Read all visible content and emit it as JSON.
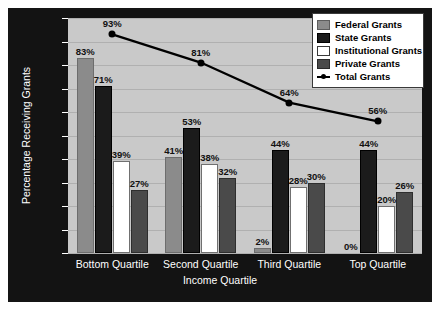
{
  "chart_data": {
    "type": "bar",
    "title": "",
    "xlabel": "Income Quartile",
    "ylabel": "Percentage Receiving Grants",
    "ylim": [
      0,
      100
    ],
    "ytick_step": 10,
    "yticks": [
      "0",
      "10",
      "20",
      "30",
      "40",
      "50",
      "60",
      "70",
      "80",
      "90",
      "100"
    ],
    "categories": [
      "Bottom Quartile",
      "Second Quartile",
      "Third Quartile",
      "Top Quartile"
    ],
    "grid": true,
    "legend_position": "top-right",
    "series": [
      {
        "name": "Federal Grants",
        "type": "bar",
        "color": "#8b8b8b",
        "values": [
          83,
          41,
          2,
          0
        ],
        "labels": [
          "83%",
          "41%",
          "2%",
          "0%"
        ]
      },
      {
        "name": "State Grants",
        "type": "bar",
        "color": "#1b1b1b",
        "values": [
          71,
          53,
          44,
          44
        ],
        "labels": [
          "71%",
          "53%",
          "44%",
          "44%"
        ]
      },
      {
        "name": "Institutional Grants",
        "type": "bar",
        "color": "#ffffff",
        "values": [
          39,
          38,
          28,
          20
        ],
        "labels": [
          "39%",
          "38%",
          "28%",
          "20%"
        ]
      },
      {
        "name": "Private Grants",
        "type": "bar",
        "color": "#4a4a4a",
        "values": [
          27,
          32,
          30,
          26
        ],
        "labels": [
          "27%",
          "32%",
          "30%",
          "26%"
        ]
      },
      {
        "name": "Total Grants",
        "type": "line",
        "color": "#000000",
        "values": [
          93,
          81,
          64,
          56
        ],
        "labels": [
          "93%",
          "81%",
          "64%",
          "56%"
        ]
      }
    ]
  },
  "legend": {
    "items": [
      {
        "label": "Federal Grants",
        "swatch": "federal"
      },
      {
        "label": "State Grants",
        "swatch": "state"
      },
      {
        "label": "Institutional Grants",
        "swatch": "institutional"
      },
      {
        "label": "Private Grants",
        "swatch": "private"
      },
      {
        "label": "Total Grants",
        "swatch": "line"
      }
    ]
  },
  "colors": {
    "frame_background": "#131313",
    "plot_background": "#c9c9c9",
    "gridline": "#b0b0b0",
    "axis_text": "#ffffff",
    "data_label": "#111111"
  }
}
